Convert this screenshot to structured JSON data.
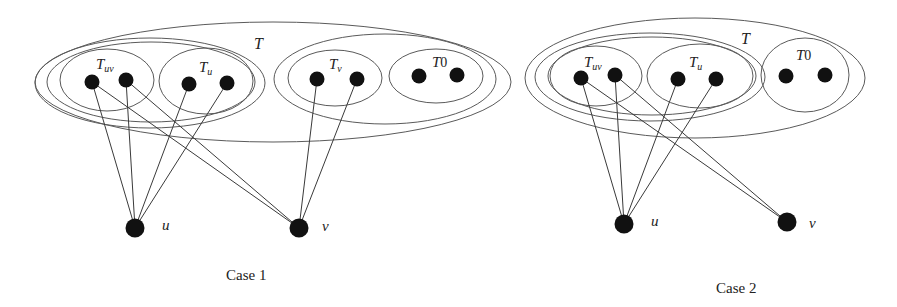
{
  "figure": {
    "panels": [
      {
        "id": "case1",
        "caption": "Case 1",
        "set_labels": {
          "T": "T",
          "Tuv_main": "T",
          "Tuv_sub": "uv",
          "Tu_main": "T",
          "Tu_sub": "u",
          "Tv_main": "T",
          "Tv_sub": "v",
          "T0_main": "T",
          "T0_sub": "0"
        },
        "vertex_labels": {
          "u": "u",
          "v": "v"
        }
      },
      {
        "id": "case2",
        "caption": "Case 2",
        "set_labels": {
          "T": "T",
          "Tuv_main": "T",
          "Tuv_sub": "uv",
          "Tu_main": "T",
          "Tu_sub": "u",
          "T0_main": "T",
          "T0_sub": "0"
        },
        "vertex_labels": {
          "u": "u",
          "v": "v"
        }
      }
    ]
  }
}
